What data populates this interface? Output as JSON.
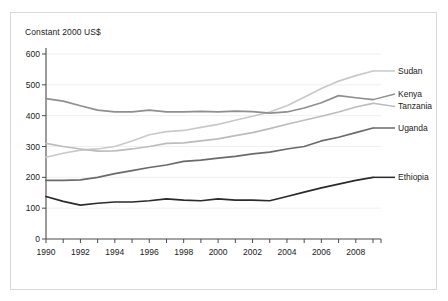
{
  "figure": {
    "axis_title": "Constant 2000 US$",
    "border_color": "#d8d8d8",
    "background": "#ffffff"
  },
  "chart_data": {
    "type": "line",
    "title": "",
    "subtitle": "",
    "xlabel": "",
    "ylabel": "Constant 2000 US$",
    "ylim": [
      0,
      600
    ],
    "xlim": [
      1990,
      2009
    ],
    "yticks": [
      0,
      100,
      200,
      300,
      400,
      500,
      600
    ],
    "ytick_labels": [
      "0",
      "100",
      "200",
      "300",
      "400",
      "500",
      "600"
    ],
    "xticks": [
      1990,
      1992,
      1994,
      1996,
      1998,
      2000,
      2002,
      2004,
      2006,
      2008
    ],
    "xtick_labels": [
      "1990",
      "1992",
      "1994",
      "1996",
      "1998",
      "2000",
      "2002",
      "2004",
      "2006",
      "2008"
    ],
    "x": [
      1990,
      1991,
      1992,
      1993,
      1994,
      1995,
      1996,
      1997,
      1998,
      1999,
      2000,
      2001,
      2002,
      2003,
      2004,
      2005,
      2006,
      2007,
      2008,
      2009
    ],
    "grid": "horizontal",
    "legend_position": "right-inline",
    "series": [
      {
        "name": "Sudan",
        "color": "#c9c9c9",
        "label_y": 545,
        "values": [
          265,
          278,
          288,
          292,
          300,
          318,
          338,
          348,
          352,
          362,
          372,
          385,
          398,
          412,
          432,
          460,
          488,
          512,
          530,
          545
        ]
      },
      {
        "name": "Kenya",
        "color": "#8f8f8f",
        "label_y": 470,
        "values": [
          455,
          447,
          432,
          418,
          412,
          412,
          418,
          412,
          412,
          414,
          412,
          415,
          413,
          408,
          412,
          425,
          442,
          465,
          458,
          452
        ]
      },
      {
        "name": "Tanzania",
        "color": "#bcbcbc",
        "label_y": 430,
        "values": [
          310,
          300,
          292,
          285,
          286,
          292,
          300,
          310,
          312,
          318,
          325,
          335,
          345,
          358,
          372,
          385,
          398,
          412,
          428,
          440
        ]
      },
      {
        "name": "Uganda",
        "color": "#6a6a6a",
        "label_y": 360,
        "values": [
          190,
          190,
          192,
          200,
          212,
          222,
          232,
          240,
          252,
          256,
          262,
          268,
          276,
          282,
          292,
          300,
          318,
          330,
          345,
          360
        ]
      },
      {
        "name": "Ethiopia",
        "color": "#2b2b2b",
        "label_y": 200,
        "values": [
          138,
          122,
          110,
          116,
          120,
          120,
          124,
          130,
          126,
          124,
          130,
          126,
          126,
          124,
          138,
          152,
          166,
          178,
          190,
          200
        ]
      }
    ]
  }
}
